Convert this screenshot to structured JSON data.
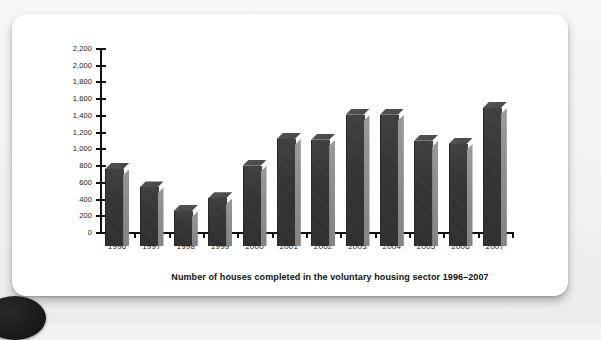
{
  "page": {
    "background_color": "#f1f1f1",
    "card_color": "#ffffff"
  },
  "figure": {
    "caption": "Number of houses completed in the voluntary housing sector 1996–2007",
    "bar_front_color": "#343434",
    "bar_side_color": "#8d8d8d",
    "axis_color": "#111111"
  },
  "chart_data": {
    "type": "bar",
    "title": "Number of houses completed in the voluntary housing sector 1996–2007",
    "xlabel": "",
    "ylabel": "",
    "ylim": [
      0,
      2200
    ],
    "ytick_step": 200,
    "grid": false,
    "legend": null,
    "ytick_labels": [
      "0",
      "200",
      "400",
      "600",
      "800",
      "1,000",
      "1,200",
      "1,400",
      "1,600",
      "1,800",
      "2,000",
      "2,200"
    ],
    "categories": [
      "1996",
      "1997",
      "1998",
      "1999",
      "2000",
      "2001",
      "2002",
      "2003",
      "2004",
      "2005",
      "2006",
      "2007"
    ],
    "values": [
      920,
      700,
      420,
      570,
      960,
      1280,
      1270,
      1570,
      1570,
      1260,
      1220,
      1650
    ]
  }
}
